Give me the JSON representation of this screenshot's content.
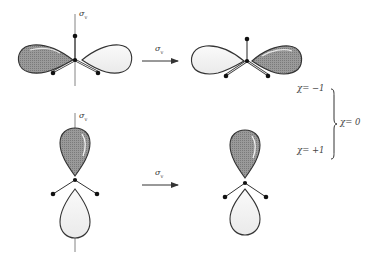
{
  "figure": {
    "operation_symbol": "σ",
    "operation_subscript": "v",
    "rows": [
      {
        "name": "in-plane p orbital",
        "before": {
          "left_lobe": "shaded",
          "right_lobe": "unshaded",
          "mirror_label": "σv"
        },
        "arrow_label": "σv",
        "after": {
          "left_lobe": "unshaded",
          "right_lobe": "shaded"
        },
        "character": "χ = −1"
      },
      {
        "name": "out-of-plane p orbital",
        "before": {
          "top_lobe": "shaded",
          "bottom_lobe": "unshaded",
          "mirror_label": "σv"
        },
        "arrow_label": "σv",
        "after": {
          "top_lobe": "shaded",
          "bottom_lobe": "unshaded"
        },
        "character": "χ = +1"
      }
    ],
    "total_character": "χ = 0"
  },
  "labels": {
    "sigma": "σ",
    "sub_v": "v",
    "chi_minus": "χ= −1",
    "chi_plus": "χ= +1",
    "chi_total": "χ= 0"
  },
  "colors": {
    "shaded_lobe": "#8a8a8a",
    "unshaded_lobe": "#f2f2f2",
    "outline": "#333333",
    "atom": "#111111",
    "line": "#555555"
  }
}
